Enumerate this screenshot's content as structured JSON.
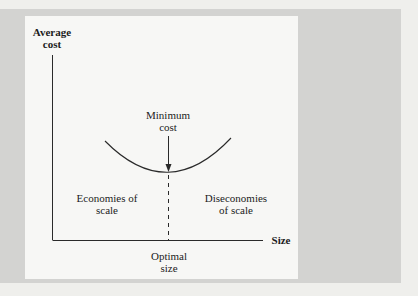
{
  "figure": {
    "axes": {
      "y_label_line1": "Average",
      "y_label_line2": "cost",
      "x_label": "Size"
    },
    "annotations": {
      "minimum_line1": "Minimum",
      "minimum_line2": "cost",
      "optimal_line1": "Optimal",
      "optimal_line2": "size",
      "left_region_line1": "Economies of",
      "left_region_line2": "scale",
      "right_region_line1": "Diseconomies",
      "right_region_line2": "of scale"
    },
    "curve": "U-shaped long-run average cost curve",
    "colors": {
      "panel": "#d3d3d1",
      "figure_bg": "#f7f7f5",
      "ink": "#1c1c1c"
    }
  }
}
